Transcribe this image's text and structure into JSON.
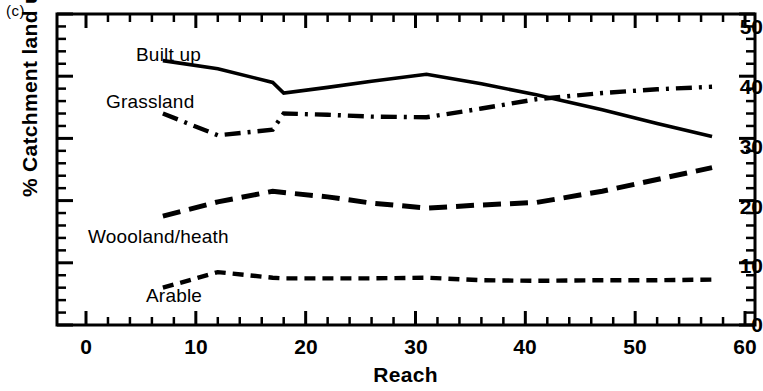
{
  "figure": {
    "panel_tag": "(c)",
    "ylabel": "% Catchment land use",
    "xlabel": "Reach"
  },
  "chart_data": {
    "type": "line",
    "title": "",
    "subtitle": "",
    "panel": "(c)",
    "xlabel": "Reach",
    "ylabel": "% Catchment land use",
    "xlim": [
      0,
      62
    ],
    "ylim": [
      0,
      50
    ],
    "xticks": [
      0,
      10,
      20,
      30,
      40,
      50,
      60
    ],
    "xtick_labels": [
      "0",
      "10",
      "20",
      "30",
      "40",
      "50",
      "60"
    ],
    "x_minor_tick_interval": 2,
    "yticks": [
      0,
      10,
      20,
      30,
      40,
      50
    ],
    "ytick_labels": [
      "0",
      "10",
      "20",
      "30",
      "40",
      "50"
    ],
    "y_minor_tick_interval": 2,
    "grid": false,
    "legend": "inline-annotations",
    "series": [
      {
        "name": "Built up",
        "style": "solid",
        "color": "#000000",
        "label_x": 18,
        "label_y": 45.5,
        "x": [
          7,
          12,
          17,
          18,
          22,
          26,
          31,
          36,
          41,
          47,
          52,
          57
        ],
        "y": [
          42.5,
          41.2,
          39.0,
          37.3,
          38.2,
          39.2,
          40.3,
          38.8,
          37.0,
          34.6,
          32.4,
          30.3
        ]
      },
      {
        "name": "Grassland",
        "style": "dashdot",
        "color": "#000000",
        "label_x": 8,
        "label_y": 37.5,
        "x": [
          7,
          12,
          17,
          18,
          22,
          26,
          31,
          36,
          41,
          47,
          52,
          57
        ],
        "y": [
          34.0,
          30.5,
          31.4,
          34.0,
          33.8,
          33.5,
          33.4,
          34.8,
          36.3,
          37.3,
          37.9,
          38.3
        ]
      },
      {
        "name": "Woooland/heath",
        "style": "longdash",
        "color": "#000000",
        "label_x": 4,
        "label_y": 14.2,
        "x": [
          7,
          12,
          17,
          18,
          22,
          26,
          31,
          36,
          41,
          47,
          52,
          57
        ],
        "y": [
          17.5,
          19.8,
          21.5,
          21.3,
          20.6,
          19.6,
          18.8,
          19.3,
          19.7,
          21.5,
          23.4,
          25.3
        ]
      },
      {
        "name": "Arable",
        "style": "shortdash",
        "color": "#000000",
        "label_x": 10,
        "label_y": 3.3,
        "x": [
          7,
          12,
          17,
          18,
          22,
          26,
          31,
          36,
          41,
          47,
          52,
          57
        ],
        "y": [
          6.0,
          8.5,
          7.6,
          7.5,
          7.5,
          7.5,
          7.6,
          7.2,
          7.1,
          7.2,
          7.2,
          7.3
        ]
      }
    ]
  },
  "axes": {
    "ytick_labels": [
      "50",
      "40",
      "30",
      "20",
      "10",
      "0"
    ],
    "xtick_labels": [
      "0",
      "10",
      "20",
      "30",
      "40",
      "50",
      "60"
    ]
  },
  "series_labels": {
    "built_up": "Built up",
    "grassland": "Grassland",
    "woodland": "Woooland/heath",
    "arable": "Arable"
  }
}
